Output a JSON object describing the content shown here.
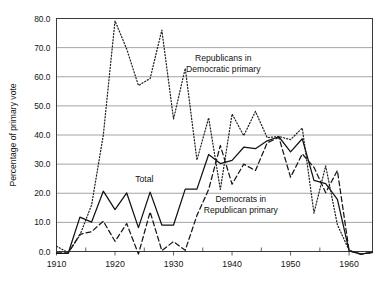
{
  "chart_data": {
    "type": "line",
    "title": "",
    "xlabel": "",
    "ylabel": "Percentage of primary vote",
    "xlim": [
      1910,
      1964
    ],
    "ylim": [
      0.0,
      80.0
    ],
    "grid": true,
    "legend_position": "inline-annotations",
    "x_ticks": [
      1910,
      1920,
      1930,
      1940,
      1950,
      1960
    ],
    "x_tick_labels": [
      "1910",
      "1920",
      "1930",
      "1940",
      "1950",
      "1960"
    ],
    "x_minor_ticks": [
      1915,
      1925,
      1935,
      1945,
      1955
    ],
    "y_ticks": [
      0.0,
      10.0,
      20.0,
      30.0,
      40.0,
      50.0,
      60.0,
      70.0,
      80.0
    ],
    "y_tick_labels": [
      "0.0",
      "10.0",
      "20.0",
      "30.0",
      "40.0",
      "50.0",
      "60.0",
      "70.0",
      "80.0"
    ],
    "x": [
      1910,
      1912,
      1914,
      1916,
      1918,
      1920,
      1922,
      1924,
      1926,
      1928,
      1930,
      1932,
      1934,
      1936,
      1938,
      1940,
      1942,
      1944,
      1946,
      1948,
      1950,
      1952,
      1954,
      1956,
      1958,
      1960,
      1962,
      1964
    ],
    "series": [
      {
        "name": "Total",
        "style": "solid",
        "values": [
          -0.6,
          -0.6,
          11.8,
          10.1,
          20.7,
          14.4,
          20.1,
          8.2,
          20.4,
          9.1,
          9.1,
          21.4,
          21.4,
          33.3,
          30.2,
          31.3,
          35.8,
          35.3,
          38.0,
          39.4,
          34.2,
          38.7,
          24.4,
          23.3,
          17.9,
          0.2,
          -0.9,
          -0.3
        ]
      },
      {
        "name": "Republicans in Democratic primary",
        "style": "dotted",
        "values": [
          1.8,
          -0.4,
          5.6,
          16.0,
          40.0,
          79.2,
          69.5,
          57.0,
          59.4,
          76.0,
          45.5,
          62.9,
          31.4,
          45.9,
          21.3,
          47.2,
          39.8,
          48.1,
          39.1,
          39.5,
          38.4,
          42.4,
          13.2,
          29.4,
          9.2,
          0.4,
          -0.8,
          -0.4
        ]
      },
      {
        "name": "Democrats in Republican primary",
        "style": "dashed",
        "values": [
          -0.5,
          -0.5,
          5.9,
          6.8,
          10.4,
          3.5,
          9.6,
          -0.9,
          13.6,
          0.3,
          3.4,
          0.4,
          12.4,
          21.3,
          36.4,
          23.1,
          30.0,
          27.8,
          37.3,
          39.2,
          25.5,
          33.5,
          28.9,
          20.2,
          27.8,
          0.3,
          -0.9,
          -0.3
        ]
      }
    ],
    "annotations": [
      {
        "name": "republicans-label",
        "lines": [
          "Republicans in",
          "Democratic primary"
        ],
        "x": 1938.5,
        "y": 65.5
      },
      {
        "name": "total-label",
        "lines": [
          "Total"
        ],
        "x": 1925.0,
        "y": 24.0
      },
      {
        "name": "democrats-label",
        "lines": [
          "Democrats in",
          "Republican primary"
        ],
        "x": 1941.5,
        "y": 17.0
      }
    ]
  }
}
